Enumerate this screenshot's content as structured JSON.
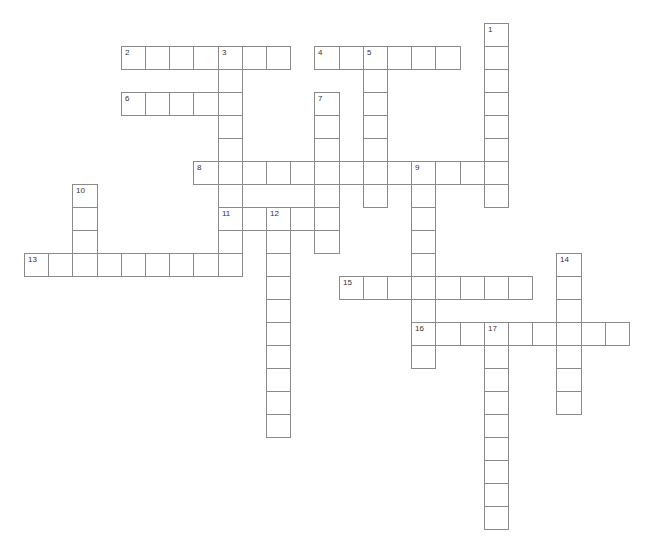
{
  "puzzle": {
    "grid": {
      "origin_x": 24,
      "origin_y": 23,
      "cell_w": 24.2,
      "cell_h": 23
    },
    "colors": {
      "border": "#8a8a8a",
      "background": "#ffffff",
      "number": "#333333"
    },
    "entries": [
      {
        "number": "1",
        "direction": "down",
        "col": 19,
        "row": 0,
        "length": 8
      },
      {
        "number": "2",
        "direction": "across",
        "col": 4,
        "row": 1,
        "length": 7
      },
      {
        "number": "3",
        "direction": "down",
        "col": 8,
        "row": 1,
        "length": 10
      },
      {
        "number": "4",
        "direction": "across",
        "col": 12,
        "row": 1,
        "length": 6
      },
      {
        "number": "5",
        "direction": "down",
        "col": 14,
        "row": 1,
        "length": 7
      },
      {
        "number": "6",
        "direction": "across",
        "col": 4,
        "row": 3,
        "length": 5
      },
      {
        "number": "7",
        "direction": "down",
        "col": 12,
        "row": 3,
        "length": 7
      },
      {
        "number": "8",
        "direction": "across",
        "col": 7,
        "row": 6,
        "length": 13
      },
      {
        "number": "9",
        "direction": "down",
        "col": 16,
        "row": 6,
        "length": 9
      },
      {
        "number": "10",
        "direction": "down",
        "col": 2,
        "row": 7,
        "length": 4
      },
      {
        "number": "11",
        "direction": "across",
        "col": 8,
        "row": 8,
        "length": 5
      },
      {
        "number": "12",
        "direction": "down",
        "col": 10,
        "row": 8,
        "length": 10
      },
      {
        "number": "13",
        "direction": "across",
        "col": 0,
        "row": 10,
        "length": 9
      },
      {
        "number": "14",
        "direction": "down",
        "col": 22,
        "row": 10,
        "length": 7
      },
      {
        "number": "15",
        "direction": "across",
        "col": 13,
        "row": 11,
        "length": 8
      },
      {
        "number": "16",
        "direction": "across",
        "col": 16,
        "row": 13,
        "length": 9
      },
      {
        "number": "17",
        "direction": "down",
        "col": 19,
        "row": 13,
        "length": 9
      }
    ]
  }
}
